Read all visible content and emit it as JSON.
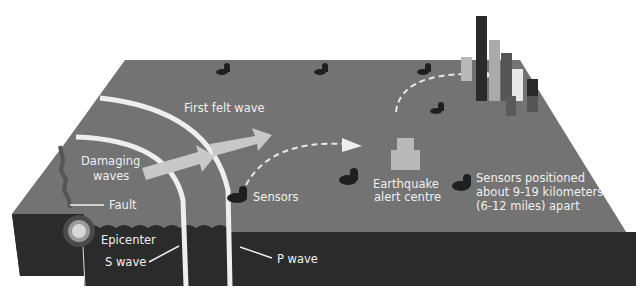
{
  "diagram": {
    "type": "earthquake-early-warning-system",
    "colors": {
      "surface": "#737373",
      "crust": "#2b2b2b",
      "wave_line": "#eeeeee",
      "arrow": "#c8c8c8",
      "sensor": "#1f1f1f",
      "label": "#f0f0f0",
      "building_light": "#b8b8b8",
      "building_dark": "#2a2a2a",
      "building_mid": "#555555",
      "building_white": "#e8e8e8"
    },
    "labels": {
      "first_felt_wave": "First felt wave",
      "damaging_line1": "Damaging",
      "damaging_line2": "waves",
      "fault": "Fault",
      "epicenter": "Epicenter",
      "s_wave": "S wave",
      "p_wave": "P wave",
      "sensors": "Sensors",
      "alert_line1": "Earthquake",
      "alert_line2": "alert centre",
      "spacing_line1": "Sensors positioned",
      "spacing_line2": "about 9-19 kilometers",
      "spacing_line3": "(6-12 miles) apart"
    },
    "nodes": [
      {
        "id": "epicenter",
        "label": "Epicenter"
      },
      {
        "id": "fault",
        "label": "Fault"
      },
      {
        "id": "p-wave",
        "label": "P wave"
      },
      {
        "id": "s-wave",
        "label": "S wave"
      },
      {
        "id": "sensors",
        "label": "Sensors"
      },
      {
        "id": "alert-centre",
        "label": "Earthquake alert centre"
      },
      {
        "id": "city",
        "label": ""
      }
    ],
    "edges": [
      {
        "from": "sensors",
        "to": "alert-centre",
        "style": "dashed"
      },
      {
        "from": "alert-centre",
        "to": "city",
        "style": "dashed"
      }
    ]
  }
}
